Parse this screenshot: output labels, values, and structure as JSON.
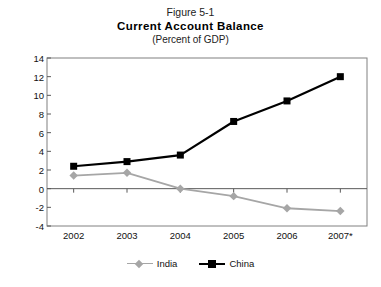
{
  "figure": {
    "number": "Figure 5-1",
    "title": "Current Account Balance",
    "subtitle": "(Percent of GDP)"
  },
  "colors": {
    "india": "#a6a6a6",
    "china": "#000000",
    "axis": "#595959",
    "frame": "#808080",
    "text": "#111111"
  },
  "chart_data": {
    "type": "line",
    "title": "Current Account Balance",
    "subtitle": "(Percent of GDP)",
    "figure_number": "Figure 5-1",
    "xlabel": "",
    "ylabel": "",
    "categories": [
      "2002",
      "2003",
      "2004",
      "2005",
      "2006",
      "2007*"
    ],
    "ylim": [
      -4,
      14
    ],
    "ytick_step": 2,
    "yticks": [
      "14",
      "12",
      "10",
      "8",
      "6",
      "4",
      "2",
      "0",
      "-2",
      "-4"
    ],
    "grid": false,
    "zero_line": true,
    "legend_position": "bottom",
    "series": [
      {
        "name": "India",
        "color": "#a6a6a6",
        "marker": "diamond",
        "values": [
          1.4,
          1.7,
          0.0,
          -0.8,
          -2.1,
          -2.4
        ]
      },
      {
        "name": "China",
        "color": "#000000",
        "marker": "square",
        "values": [
          2.4,
          2.9,
          3.6,
          7.2,
          9.4,
          12.0
        ]
      }
    ]
  }
}
